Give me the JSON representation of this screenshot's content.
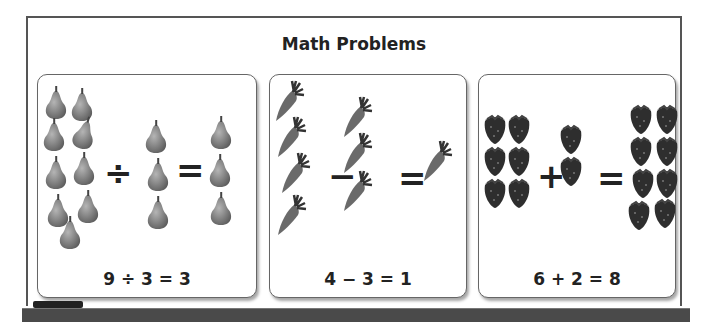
{
  "board": {
    "title": "Math Problems"
  },
  "panels": [
    {
      "fruit": "pear",
      "left_count": 9,
      "operator": "÷",
      "right_count": 3,
      "result_count": 3,
      "equation": "9 ÷ 3 = 3"
    },
    {
      "fruit": "carrot",
      "left_count": 4,
      "operator": "−",
      "right_count": 3,
      "result_count": 1,
      "equation": "4 − 3 = 1"
    },
    {
      "fruit": "strawberry",
      "left_count": 6,
      "operator": "+",
      "right_count": 2,
      "result_count": 8,
      "equation": "6 + 2 = 8"
    }
  ],
  "symbols": {
    "equals": "="
  },
  "colors": {
    "fruit_gray": "#7a7a7a",
    "fruit_dark": "#333333",
    "border": "#555555",
    "tray": "#4a4a4a"
  }
}
